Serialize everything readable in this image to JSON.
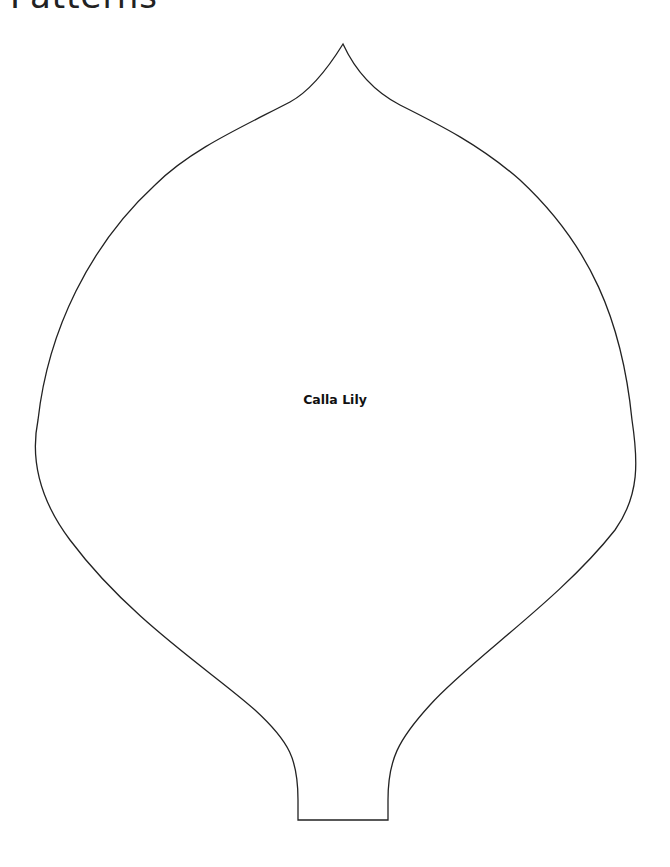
{
  "page": {
    "title": "Patterns"
  },
  "pattern": {
    "name": "Calla Lily",
    "stroke_color": "#222222",
    "background": "#ffffff"
  }
}
